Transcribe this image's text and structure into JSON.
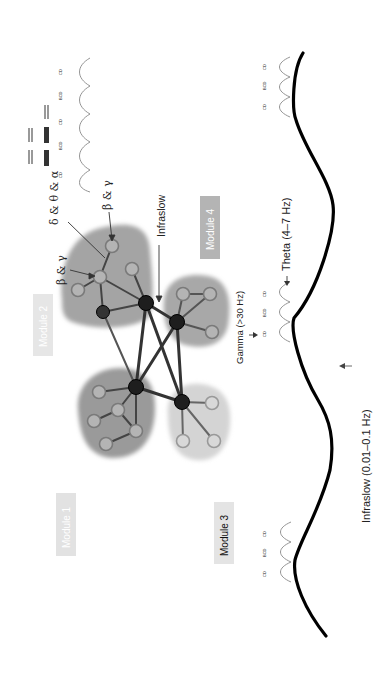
{
  "figure": {
    "orientation": "rotated-90-ccw",
    "modules": [
      {
        "id": "module1",
        "label": "Module 1",
        "box_fill": "#e2e2e2",
        "text_color": "#ffffff"
      },
      {
        "id": "module2",
        "label": "Module 2",
        "box_fill": "#e6e6e6",
        "text_color": "#ffffff"
      },
      {
        "id": "module3",
        "label": "Module 3",
        "box_fill": "#e4e4e4",
        "text_color": "#111111"
      },
      {
        "id": "module4",
        "label": "Module 4",
        "box_fill": "#b4b4b4",
        "text_color": "#ffffff"
      }
    ],
    "annotations": {
      "delta_theta_alpha": "δ & θ & α",
      "beta_gamma_top": "β & γ",
      "beta_gamma_lower": "β & γ",
      "infraslow_arrow": "Infraslow"
    },
    "oscillations": {
      "gamma": "Gamma (>30 Hz)",
      "theta": "Theta (4–7 Hz)",
      "infraslow": "Infraslow (0.01–0.1 Hz)"
    },
    "wavelet_letters": [
      "A",
      "B",
      "C",
      "D",
      "E"
    ],
    "colors": {
      "module1_blob": "#9a9a9a",
      "module2_blob": "#a4a4a4",
      "module3_blob": "#d4d4d4",
      "module4_blob": "#a8a8a8",
      "hub_node": "#1e1e1e",
      "leaf_node": "#b0b0b0",
      "edge": "#333333",
      "wave": "#000000"
    }
  }
}
